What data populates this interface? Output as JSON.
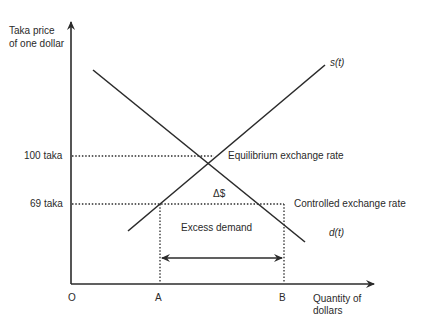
{
  "diagram": {
    "type": "supply-demand",
    "y_axis_label_line1": "Taka price",
    "y_axis_label_line2": "of one dollar",
    "x_axis_label_line1": "Quantity of",
    "x_axis_label_line2": "dollars",
    "origin_label": "O",
    "y_ticks": [
      {
        "label": "100 taka",
        "value": 100
      },
      {
        "label": "69 taka",
        "value": 69
      }
    ],
    "x_ticks": [
      {
        "label": "A"
      },
      {
        "label": "B"
      }
    ],
    "curves": [
      {
        "name": "supply",
        "label": "s(t)"
      },
      {
        "name": "demand",
        "label": "d(t)"
      }
    ],
    "annotations": {
      "equilibrium": "Equilibrium exchange rate",
      "controlled": "Controlled exchange rate",
      "delta": "Δ$",
      "excess": "Excess demand"
    },
    "colors": {
      "line": "#2b2b2b",
      "text": "#2a2a2a",
      "background": "#ffffff"
    }
  }
}
